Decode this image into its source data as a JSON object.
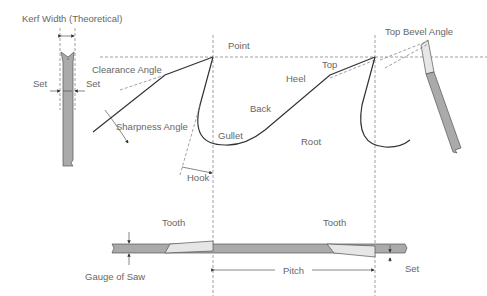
{
  "labels": {
    "kerf_width": "Kerf Width (Theoretical)",
    "set_left": "Set",
    "set_right": "Set",
    "clearance_angle": "Clearance Angle",
    "sharpness_angle": "Sharpness Angle",
    "hook": "Hook",
    "point": "Point",
    "gullet": "Gullet",
    "back": "Back",
    "heel": "Heel",
    "top": "Top",
    "root": "Root",
    "top_bevel_angle": "Top Bevel Angle",
    "tooth_left": "Tooth",
    "tooth_right": "Tooth",
    "gauge_of_saw": "Gauge of Saw",
    "pitch": "Pitch",
    "set_bottom": "Set"
  }
}
